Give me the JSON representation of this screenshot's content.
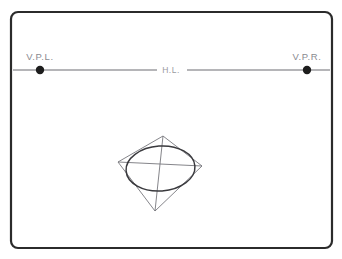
{
  "diagram": {
    "canvas": {
      "width": 342,
      "height": 259,
      "background": "#ffffff"
    },
    "frame": {
      "name": "outer-border",
      "x": 11,
      "y": 12,
      "width": 321,
      "height": 236,
      "corner_radius": 7,
      "stroke_color": "#2b2b2b",
      "stroke_width": 2.2
    },
    "horizon": {
      "label": "H.L.",
      "label_x": 171,
      "label_y": 73,
      "y": 70,
      "left_x": 13,
      "right_x": 330,
      "gap_left_x": 157,
      "gap_right_x": 187,
      "color": "#6d6d72"
    },
    "vanishing_points": [
      {
        "id": "vpl",
        "label": "V.P.L.",
        "cx": 40,
        "cy": 70,
        "r": 4.2,
        "label_x": 21,
        "label_y": 60,
        "color": "#1d1d1d"
      },
      {
        "id": "vpr",
        "label": "V.P.R.",
        "cx": 307,
        "cy": 70,
        "r": 4.2,
        "label_x": 286,
        "label_y": 60,
        "color": "#1d1d1d"
      }
    ],
    "square": {
      "name": "perspective-square",
      "points": "118,162 163,136 202,166 155,211",
      "stroke_color": "#77777d",
      "corners": {
        "left": [
          118,
          162
        ],
        "top": [
          163,
          136
        ],
        "right": [
          202,
          166
        ],
        "bottom": [
          155,
          211
        ]
      }
    },
    "diagonals": [
      {
        "id": "diagonal-left-right",
        "x1": 118,
        "y1": 162,
        "x2": 202,
        "y2": 166
      },
      {
        "id": "diagonal-top-bottom",
        "x1": 163,
        "y1": 136,
        "x2": 155,
        "y2": 211
      }
    ],
    "ellipse": {
      "name": "inscribed-ellipse",
      "cx": 160.5,
      "cy": 168.5,
      "rx": 34.5,
      "ry": 22.5,
      "rotation": -4,
      "stroke_color": "#3a3a3e",
      "stroke_width": 1.5
    }
  }
}
